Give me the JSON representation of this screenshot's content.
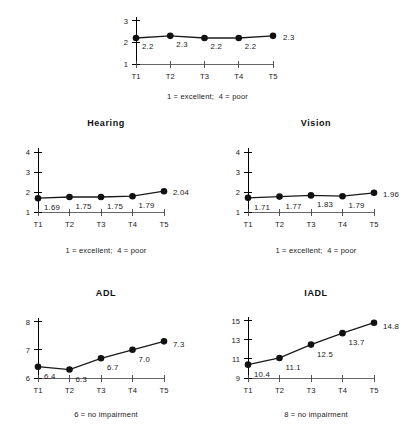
{
  "figure": {
    "background": "#ffffff",
    "line_color": "#1a1a1a",
    "marker_color": "#111111",
    "axis_color": "#000000"
  },
  "panels": {
    "health": {
      "title": "",
      "caption": "1 = excellent;  4 = poor"
    },
    "hearing": {
      "title": "Hearing",
      "caption": "1 = excellent;  4 = poor"
    },
    "vision": {
      "title": "Vision",
      "caption": "1 = excellent;  4 = poor"
    },
    "adl": {
      "title": "ADL",
      "caption": "6 = no impairment"
    },
    "iadl": {
      "title": "IADL",
      "caption": "8 = no impairment"
    }
  },
  "chart_data": [
    {
      "id": "health",
      "type": "line",
      "title": "",
      "xlabel": "",
      "ylabel": "",
      "categories": [
        "T1",
        "T2",
        "T3",
        "T4",
        "T5"
      ],
      "values": [
        2.2,
        2.3,
        2.2,
        2.2,
        2.3
      ],
      "point_labels": [
        "2.2",
        "2.3",
        "2.2",
        "2.2",
        "2.3"
      ],
      "ylim": [
        1,
        3.4
      ],
      "yticks": [
        1,
        2,
        3
      ],
      "ytick_labels": [
        "1",
        "2",
        "3"
      ],
      "grid": false,
      "legend": "none",
      "annotation": "1 = excellent;  4 = poor"
    },
    {
      "id": "hearing",
      "type": "line",
      "title": "Hearing",
      "xlabel": "",
      "ylabel": "",
      "categories": [
        "T1",
        "T2",
        "T3",
        "T4",
        "T5"
      ],
      "values": [
        1.69,
        1.75,
        1.75,
        1.79,
        2.04
      ],
      "point_labels": [
        "1.69",
        "1.75",
        "1.75",
        "1.79",
        "2.04"
      ],
      "ylim": [
        1,
        4.2
      ],
      "yticks": [
        1,
        2,
        3,
        4
      ],
      "ytick_labels": [
        "1",
        "2",
        "3",
        "4"
      ],
      "grid": false,
      "legend": "none",
      "annotation": "1 = excellent;  4 = poor"
    },
    {
      "id": "vision",
      "type": "line",
      "title": "Vision",
      "xlabel": "",
      "ylabel": "",
      "categories": [
        "T1",
        "T2",
        "T3",
        "T4",
        "T5"
      ],
      "values": [
        1.71,
        1.77,
        1.83,
        1.79,
        1.96
      ],
      "point_labels": [
        "1.71",
        "1.77",
        "1.83",
        "1.79",
        "1.96"
      ],
      "ylim": [
        1,
        4.2
      ],
      "yticks": [
        1,
        2,
        3,
        4
      ],
      "ytick_labels": [
        "1",
        "2",
        "3",
        "4"
      ],
      "grid": false,
      "legend": "none",
      "annotation": "1 = excellent;  4 = poor"
    },
    {
      "id": "adl",
      "type": "line",
      "title": "ADL",
      "xlabel": "",
      "ylabel": "",
      "categories": [
        "T1",
        "T2",
        "T3",
        "T4",
        "T5"
      ],
      "values": [
        6.4,
        6.3,
        6.7,
        7.0,
        7.3
      ],
      "point_labels": [
        "6.4",
        "6.3",
        "6.7",
        "7.0",
        "7.3"
      ],
      "ylim": [
        6,
        8.2
      ],
      "yticks": [
        6,
        7,
        8
      ],
      "ytick_labels": [
        "6",
        "7",
        "8"
      ],
      "grid": false,
      "legend": "none",
      "annotation": "6 = no impairment"
    },
    {
      "id": "iadl",
      "type": "line",
      "title": "IADL",
      "xlabel": "",
      "ylabel": "",
      "categories": [
        "T1",
        "T2",
        "T3",
        "T4",
        "T5"
      ],
      "values": [
        10.4,
        11.1,
        12.5,
        13.7,
        14.8
      ],
      "point_labels": [
        "10.4",
        "11.1",
        "12.5",
        "13.7",
        "14.8"
      ],
      "ylim": [
        9,
        15.5
      ],
      "yticks": [
        9,
        11,
        13,
        15
      ],
      "ytick_labels": [
        "9",
        "11",
        "13",
        "15"
      ],
      "grid": false,
      "legend": "none",
      "annotation": "8 = no impairment"
    }
  ]
}
